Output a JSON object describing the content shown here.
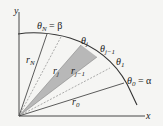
{
  "diagram": {
    "colors": {
      "background": "#f5f5f3",
      "line": "#333333",
      "shaded_sector": "#b8b8b8",
      "dashed": "#777777"
    },
    "axes": {
      "x_label": "x",
      "y_label": "y"
    },
    "angle_labels": [
      {
        "id": "theta_N",
        "base": "θ",
        "sub": "N",
        "suffix": " = β"
      },
      {
        "id": "theta_j",
        "base": "θ",
        "sub": "j",
        "suffix": ""
      },
      {
        "id": "theta_j_minus_1",
        "base": "θ",
        "sub": "j−1",
        "suffix": ""
      },
      {
        "id": "theta_1",
        "base": "θ",
        "sub": "1",
        "suffix": ""
      },
      {
        "id": "theta_0",
        "base": "θ",
        "sub": "0",
        "suffix": " = α"
      }
    ],
    "radius_labels": [
      {
        "id": "r_N",
        "base": "r",
        "sub": "N"
      },
      {
        "id": "r_j",
        "base": "r",
        "sub": "j"
      },
      {
        "id": "r_j_minus_1",
        "base": "r",
        "sub": "j−1"
      },
      {
        "id": "r_0",
        "base": "r",
        "sub": "0"
      }
    ]
  }
}
